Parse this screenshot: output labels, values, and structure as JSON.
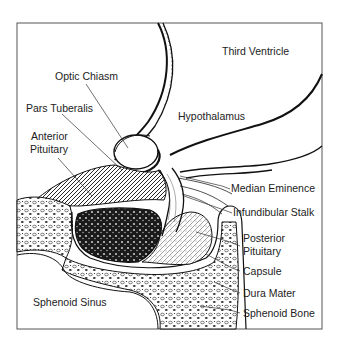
{
  "figure": {
    "type": "anatomical-diagram"
  },
  "labels": {
    "third_ventricle": "Third Ventricle",
    "optic_chiasm": "Optic Chiasm",
    "hypothalamus": "Hypothalamus",
    "pars_tuberalis": "Pars Tuberalis",
    "anterior_pituitary_1": "Anterior",
    "anterior_pituitary_2": "Pituitary",
    "median_eminence": "Median Eminence",
    "infundibular_stalk": "Infundibular Stalk",
    "posterior_pituitary_1": "Posterior",
    "posterior_pituitary_2": "Pituitary",
    "capsule": "Capsule",
    "dura_mater": "Dura Mater",
    "sphenoid_bone": "Sphenoid Bone",
    "sphenoid_sinus": "Sphenoid Sinus"
  },
  "colors": {
    "ink": "#111111",
    "label": "#222222",
    "background": "#ffffff",
    "anterior_fill": "#1a1a1a"
  }
}
